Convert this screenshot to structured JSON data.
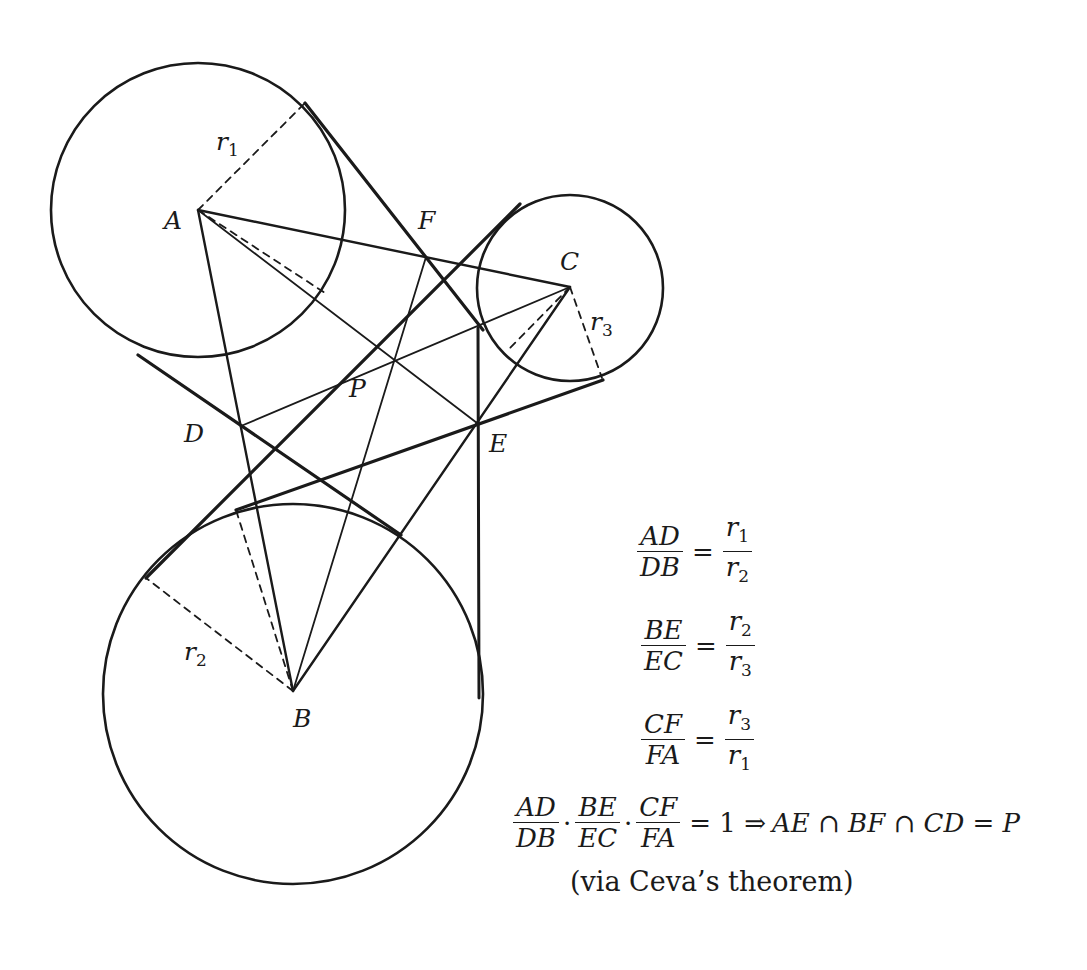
{
  "figure": {
    "points": {
      "A": {
        "label": "A",
        "x": 198,
        "y": 210
      },
      "B": {
        "label": "B",
        "x": 293,
        "y": 691
      },
      "C": {
        "label": "C",
        "x": 570,
        "y": 287
      },
      "D": {
        "label": "D",
        "x": 241,
        "y": 426
      },
      "E": {
        "label": "E",
        "x": 477,
        "y": 423
      },
      "F": {
        "label": "F",
        "x": 426,
        "y": 257
      },
      "P": {
        "label": "P",
        "x": 396,
        "y": 361
      }
    },
    "circles": [
      {
        "center": "A",
        "radius_label": "r",
        "radius_sub": "1",
        "r": 147
      },
      {
        "center": "B",
        "radius_label": "r",
        "radius_sub": "2",
        "r": 190
      },
      {
        "center": "C",
        "radius_label": "r",
        "radius_sub": "3",
        "r": 93
      }
    ]
  },
  "equations": {
    "eq1": {
      "num": "AD",
      "den": "DB",
      "eq": "=",
      "rnum": "r",
      "rnum_sub": "1",
      "rden": "r",
      "rden_sub": "2"
    },
    "eq2": {
      "num": "BE",
      "den": "EC",
      "eq": "=",
      "rnum": "r",
      "rnum_sub": "2",
      "rden": "r",
      "rden_sub": "3"
    },
    "eq3": {
      "num": "CF",
      "den": "FA",
      "eq": "=",
      "rnum": "r",
      "rnum_sub": "3",
      "rden": "r",
      "rden_sub": "1"
    },
    "product": {
      "f1_num": "AD",
      "f1_den": "DB",
      "dot": "·",
      "f2_num": "BE",
      "f2_den": "EC",
      "f3_num": "CF",
      "f3_den": "FA",
      "result": "= 1 ⇒",
      "conclusion": "AE ∩ BF ∩ CD = P"
    },
    "caption": "(via Ceva’s theorem)"
  }
}
